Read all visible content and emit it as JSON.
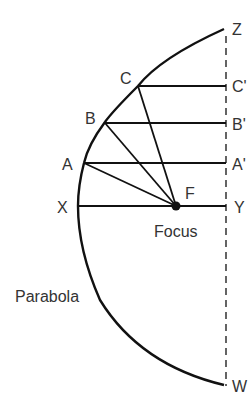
{
  "diagram": {
    "labels": {
      "Z": "Z",
      "C": "C",
      "C_prime": "C'",
      "B": "B",
      "B_prime": "B'",
      "A": "A",
      "A_prime": "A'",
      "X": "X",
      "Y": "Y",
      "F": "F",
      "focus": "Focus",
      "parabola": "Parabola",
      "W": "W"
    },
    "colors": {
      "stroke": "#111111",
      "text": "#333333"
    }
  }
}
